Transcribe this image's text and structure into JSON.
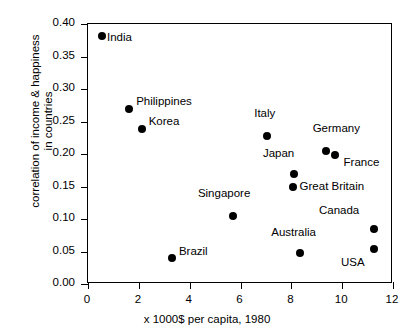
{
  "chart_data": {
    "type": "scatter",
    "title": "",
    "xlabel": "x 1000$ per capita, 1980",
    "ylabel_line1": "correlation of income & happiness",
    "ylabel_line2": "in countries",
    "xlim": [
      0,
      12
    ],
    "ylim": [
      0.0,
      0.4
    ],
    "xticks": [
      "0",
      "2",
      "4",
      "6",
      "8",
      "10",
      "12"
    ],
    "xtick_values": [
      0,
      2,
      4,
      6,
      8,
      10,
      12
    ],
    "yticks": [
      "0.00",
      "0.05",
      "0.10",
      "0.15",
      "0.20",
      "0.25",
      "0.30",
      "0.35",
      "0.40"
    ],
    "ytick_values": [
      0.0,
      0.05,
      0.1,
      0.15,
      0.2,
      0.25,
      0.3,
      0.35,
      0.4
    ],
    "grid": false,
    "legend": "none",
    "marker_color": "#000000",
    "points": [
      {
        "label": "India",
        "x": 0.55,
        "y": 0.381,
        "lx": 6,
        "ly": 2
      },
      {
        "label": "Philippines",
        "x": 1.62,
        "y": 0.27,
        "lx": 8,
        "ly": -7
      },
      {
        "label": "Korea",
        "x": 2.11,
        "y": 0.239,
        "lx": 8,
        "ly": -7
      },
      {
        "label": "Brazil",
        "x": 3.3,
        "y": 0.04,
        "lx": 8,
        "ly": -6
      },
      {
        "label": "Singapore",
        "x": 5.7,
        "y": 0.105,
        "lx": -34,
        "ly": -22
      },
      {
        "label": "Italy",
        "x": 7.05,
        "y": 0.227,
        "lx": -12,
        "ly": -22
      },
      {
        "label": "Great Britain",
        "x": 8.05,
        "y": 0.149,
        "lx": 8,
        "ly": 0
      },
      {
        "label": "Japan",
        "x": 8.1,
        "y": 0.169,
        "lx": -30,
        "ly": -20
      },
      {
        "label": "Australia",
        "x": 8.35,
        "y": 0.048,
        "lx": -28,
        "ly": -20
      },
      {
        "label": "Germany",
        "x": 9.35,
        "y": 0.204,
        "lx": -12,
        "ly": -22
      },
      {
        "label": "France",
        "x": 9.7,
        "y": 0.199,
        "lx": 10,
        "ly": 8
      },
      {
        "label": "Canada",
        "x": 11.25,
        "y": 0.084,
        "lx": -54,
        "ly": -18
      },
      {
        "label": "USA",
        "x": 11.25,
        "y": 0.054,
        "lx": -32,
        "ly": 14
      }
    ]
  }
}
